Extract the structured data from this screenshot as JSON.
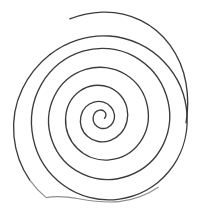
{
  "canvas": {
    "width": 199,
    "height": 211,
    "background_color": "#ffffff",
    "alt_text": "Hand-drawn spiral"
  },
  "drawing": {
    "name": "spiral",
    "title": "Spiral",
    "stroke_color": "#3c3c40",
    "stroke_color_faint": "#8d8d93",
    "stroke_width": 1.35,
    "stroke_width_faint": 1.1,
    "center_x": 100,
    "center_y": 116,
    "turns": 4.5,
    "direction": "counterclockwise-outward",
    "bounds": {
      "left": 13,
      "top": 12,
      "right": 191,
      "bottom": 203
    },
    "paths": {
      "main": "M 104.5 118.2 C 106.6 116.2 106.4 112.8 104.2 111.2 C 101.6 109.2 97.6 109.9 95.4 112.3 C 92.6 115.3 92.3 120.4 94.6 123.9 C 97.2 128.0 102.6 129.5 107.1 127.8 C 112.2 125.9 115.0 120.3 114.5 115.0 C 113.9 109.0 109.3 104.0 103.6 102.2 C 97.3 100.2 90.2 102.2 85.7 106.9 C 80.7 112.1 79.2 120.1 81.3 127.0 C 83.6 134.5 90.4 140.2 98.1 141.5 C 106.5 142.9 115.3 139.6 120.9 133.3 C 126.9 126.5 129.0 116.7 126.9 107.9 C 124.7 98.5 117.8 90.6 108.8 87.2 C 99.3 83.6 88.1 85.1 79.9 91.0 C 71.2 97.2 66.1 107.6 65.6 118.2 C 65.1 129.4 69.5 140.6 77.4 148.5 C 85.7 156.8 97.7 161.0 109.3 159.9 C 121.5 158.8 132.8 152.3 139.9 142.4 C 147.3 132.0 149.9 118.6 147.4 106.1 C 144.8 93.0 136.6 81.3 125.3 74.3 C 113.5 67.0 98.8 65.3 85.7 69.4 C 72.0 73.6 60.4 83.6 54.2 96.5 C 47.7 110.0 47.0 126.1 51.9 140.2 C 57.0 154.8 68.0 167.0 81.8 173.6 C 96.1 180.5 113.0 181.2 127.9 176.0 C 143.3 170.6 156.2 159.1 163.3 144.4 C 170.6 129.2 171.5 111.2 166.3 95.3 C 161.0 78.9 149.2 64.8 134.1 56.4 C 118.6 47.8 99.8 46.1 83.0 51.2 C 65.7 56.5 50.6 68.4 41.5 84.2 C 32.2 100.4 29.4 120.1 33.2 138.3 C 37.0 156.9 48.0 173.7 63.2 185.0 C 78.8 196.6 98.8 201.6 118.0 199.3 C 137.7 197.0 156.0 187.0 168.6 171.8 C 181.4 156.4 188.0 136.2 187.1 116.2 C 186.2 95.9 177.8 76.1 163.7 61.5 C 149.5 46.6 129.7 37.3 109.2 36.0 C 88.2 34.6 66.7 41.3 50.0 54.5",
      "outer_turn": "M 50.0 54.5 C 33.0 68.1 21.3 88.2 17.8 109.8 C 14.2 132.0 18.8 155.3 30.6 174.2 C 42.5 193.4 61.7 207.9 83.4 213.6",
      "outer_left_flank": "M 50.2 54.3 C 38.5 63.6 28.8 75.5 22.3 89.0 C 15.2 103.7 12.4 120.5 14.0 136.7 C 15.5 152.2 21.0 167.3 29.8 180.1",
      "outer_bottom_faint": "M 29.8 180.1 C 34.5 186.7 40.0 192.6 46.2 197.6 C 57.0 195.4 68.0 196.8 78.8 198.8 C 92.0 201.2 105.6 203.0 119.0 201.6 C 133.0 200.1 146.6 195.2 158.2 187.2",
      "top_tail": "M 69.8 18.8 C 80.0 15.0 90.9 12.6 101.8 12.2 C 115.0 11.7 128.3 14.4 140.2 20.2 C 152.0 25.9 162.3 34.6 170.0 45.2 C 178.2 56.4 183.6 69.6 186.0 83.2 C 188.3 96.2 188.2 109.8 186.0 122.8"
    }
  },
  "legend": {
    "visible": false
  }
}
